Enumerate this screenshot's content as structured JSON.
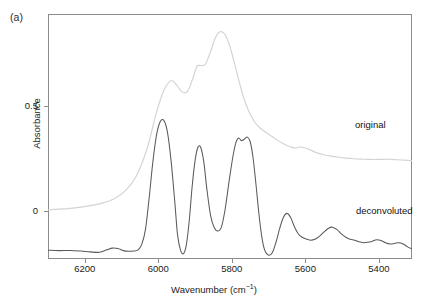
{
  "figure": {
    "panel_label": "(a)"
  },
  "axes": {
    "x": {
      "title_main": "Wavenumber (cm",
      "title_exponent": "−1",
      "title_close": ")",
      "ticks": [
        {
          "label": "6200",
          "value": 6200
        },
        {
          "label": "6000",
          "value": 6000
        },
        {
          "label": "5800",
          "value": 5800
        },
        {
          "label": "5600",
          "value": 5600
        },
        {
          "label": "5400",
          "value": 5400
        }
      ],
      "range": [
        6300,
        5310
      ],
      "reversed": true
    },
    "y": {
      "title": "Absorbance",
      "ticks": [
        {
          "label": "0.5",
          "value": 0.5
        },
        {
          "label": "0",
          "value": 0
        }
      ],
      "range": [
        -0.23,
        0.94
      ]
    }
  },
  "annotations": {
    "original_label": "original",
    "deconvoluted_label": "deconvoluted"
  },
  "colors": {
    "original": "#d3d3d3",
    "deconvoluted": "#5a5a5a",
    "frame": "#8c8c8c",
    "background": "#ffffff",
    "text": "#1a1a1a"
  },
  "chart_data": {
    "type": "line",
    "title": "",
    "xlabel": "Wavenumber (cm−1)",
    "ylabel": "Absorbance",
    "xlim": [
      6300,
      5310
    ],
    "ylim": [
      -0.23,
      0.94
    ],
    "grid": false,
    "legend": "inline-annotations",
    "x_axis_inverted": true,
    "series": [
      {
        "name": "original",
        "color": "#d3d3d3",
        "x": [
          6300,
          6270,
          6240,
          6210,
          6180,
          6150,
          6120,
          6090,
          6060,
          6030,
          6005,
          5985,
          5965,
          5950,
          5935,
          5920,
          5905,
          5895,
          5885,
          5872,
          5858,
          5845,
          5832,
          5820,
          5808,
          5795,
          5782,
          5770,
          5755,
          5740,
          5725,
          5710,
          5695,
          5680,
          5665,
          5650,
          5635,
          5625,
          5615,
          5600,
          5585,
          5570,
          5550,
          5530,
          5510,
          5490,
          5470,
          5450,
          5430,
          5410,
          5390,
          5370,
          5350,
          5330,
          5310
        ],
        "y": [
          0.005,
          0.008,
          0.012,
          0.018,
          0.026,
          0.038,
          0.058,
          0.095,
          0.165,
          0.3,
          0.47,
          0.575,
          0.622,
          0.6,
          0.567,
          0.572,
          0.638,
          0.69,
          0.694,
          0.7,
          0.76,
          0.825,
          0.855,
          0.845,
          0.8,
          0.72,
          0.63,
          0.552,
          0.48,
          0.43,
          0.398,
          0.378,
          0.36,
          0.342,
          0.325,
          0.312,
          0.302,
          0.3,
          0.305,
          0.3,
          0.29,
          0.278,
          0.268,
          0.261,
          0.256,
          0.252,
          0.249,
          0.247,
          0.246,
          0.245,
          0.246,
          0.246,
          0.244,
          0.242,
          0.24
        ]
      },
      {
        "name": "deconvoluted",
        "color": "#5a5a5a",
        "x": [
          6300,
          6270,
          6240,
          6210,
          6185,
          6160,
          6140,
          6125,
          6110,
          6095,
          6080,
          6068,
          6055,
          6045,
          6035,
          6025,
          6015,
          6005,
          5995,
          5985,
          5975,
          5965,
          5955,
          5948,
          5940,
          5932,
          5924,
          5916,
          5908,
          5900,
          5892,
          5884,
          5876,
          5868,
          5858,
          5848,
          5838,
          5828,
          5818,
          5808,
          5798,
          5790,
          5782,
          5774,
          5766,
          5758,
          5750,
          5742,
          5734,
          5726,
          5718,
          5710,
          5700,
          5690,
          5680,
          5670,
          5660,
          5650,
          5640,
          5630,
          5620,
          5610,
          5598,
          5586,
          5574,
          5562,
          5550,
          5538,
          5526,
          5514,
          5502,
          5490,
          5478,
          5466,
          5454,
          5442,
          5430,
          5418,
          5406,
          5394,
          5382,
          5370,
          5358,
          5346,
          5334,
          5322,
          5310
        ],
        "y": [
          -0.188,
          -0.19,
          -0.189,
          -0.192,
          -0.196,
          -0.198,
          -0.186,
          -0.178,
          -0.18,
          -0.19,
          -0.193,
          -0.192,
          -0.186,
          -0.16,
          -0.09,
          0.06,
          0.23,
          0.36,
          0.425,
          0.432,
          0.375,
          0.235,
          0.04,
          -0.11,
          -0.185,
          -0.205,
          -0.165,
          -0.05,
          0.115,
          0.24,
          0.305,
          0.3,
          0.23,
          0.105,
          -0.02,
          -0.08,
          -0.096,
          -0.075,
          0.01,
          0.135,
          0.25,
          0.32,
          0.348,
          0.335,
          0.342,
          0.352,
          0.33,
          0.25,
          0.12,
          -0.02,
          -0.13,
          -0.19,
          -0.212,
          -0.2,
          -0.15,
          -0.085,
          -0.032,
          -0.012,
          -0.032,
          -0.075,
          -0.108,
          -0.125,
          -0.135,
          -0.14,
          -0.136,
          -0.122,
          -0.102,
          -0.084,
          -0.078,
          -0.09,
          -0.11,
          -0.126,
          -0.136,
          -0.14,
          -0.148,
          -0.152,
          -0.15,
          -0.145,
          -0.138,
          -0.142,
          -0.152,
          -0.158,
          -0.156,
          -0.152,
          -0.158,
          -0.172,
          -0.182
        ]
      }
    ]
  }
}
